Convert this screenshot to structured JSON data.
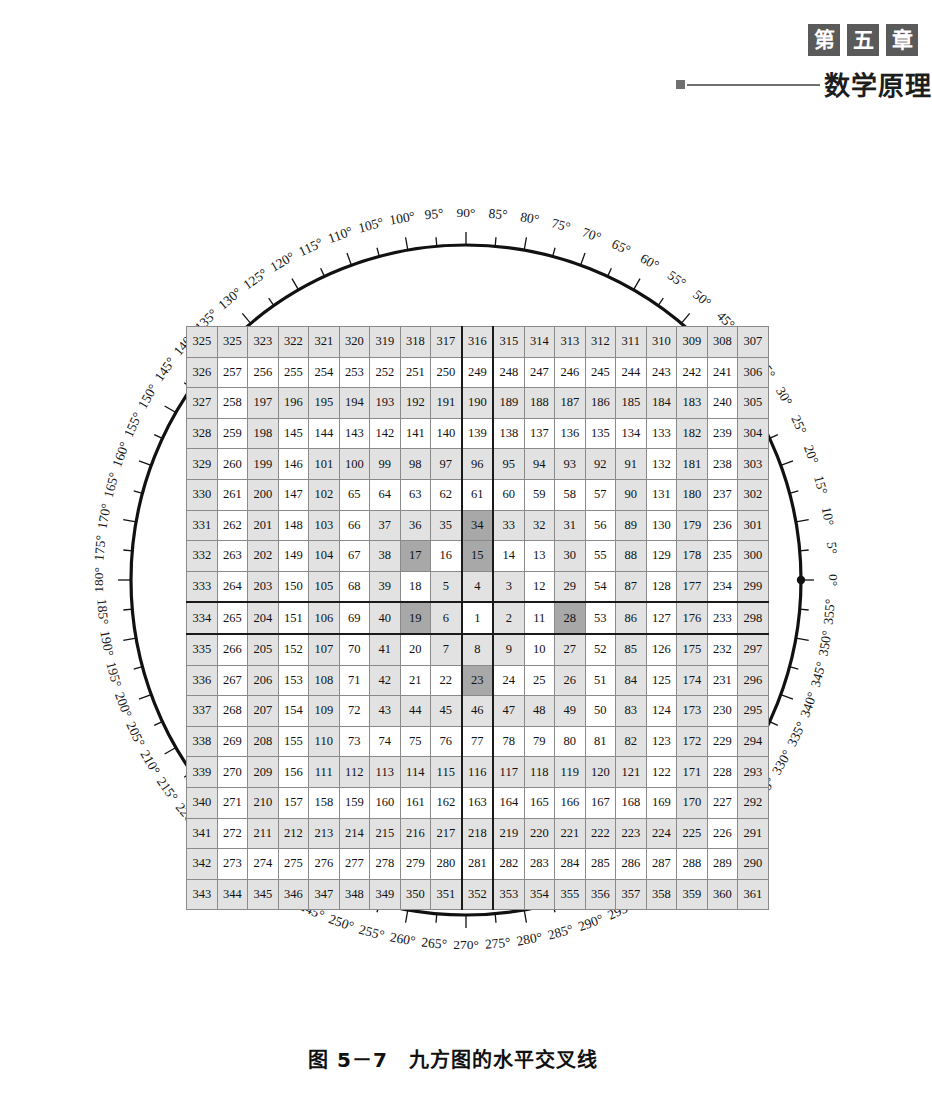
{
  "header": {
    "chapter_boxes": [
      "第",
      "五",
      "章"
    ],
    "running_title": "数学原理"
  },
  "caption": "图 5－7　九方图的水平交叉线",
  "dial": {
    "unit": "°",
    "step": 5,
    "start": 0,
    "count": 72,
    "zero_marker": "dot",
    "labels": [
      "0°",
      "5°",
      "10°",
      "15°",
      "20°",
      "25°",
      "30°",
      "35°",
      "40°",
      "45°",
      "50°",
      "55°",
      "60°",
      "65°",
      "70°",
      "75°",
      "80°",
      "85°",
      "90°",
      "95°",
      "100°",
      "105°",
      "110°",
      "115°",
      "120°",
      "125°",
      "130°",
      "135°",
      "140°",
      "145°",
      "150°",
      "155°",
      "160°",
      "165°",
      "170°",
      "175°",
      "180°",
      "185°",
      "190°",
      "195°",
      "200°",
      "205°",
      "210°",
      "215°",
      "220°",
      "225°",
      "230°",
      "235°",
      "240°",
      "245°",
      "250°",
      "255°",
      "260°",
      "265°",
      "270°",
      "275°",
      "280°",
      "285°",
      "290°",
      "295°",
      "300°",
      "305°",
      "310°",
      "315°",
      "320°",
      "325°",
      "330°",
      "335°",
      "340°",
      "345°",
      "350°",
      "355°"
    ]
  },
  "chart_data": {
    "type": "table",
    "title": "九方图的水平交叉线",
    "rows": 19,
    "cols": 19,
    "center_value": 1,
    "center_row": 10,
    "center_col": 10,
    "highlight_dark": [
      34,
      15,
      17,
      19,
      28,
      23
    ],
    "cross_line_row": 10,
    "cross_line_col": 10,
    "grid": [
      [
        325,
        325,
        323,
        322,
        321,
        320,
        319,
        318,
        317,
        316,
        315,
        314,
        313,
        312,
        311,
        310,
        309,
        308,
        307
      ],
      [
        326,
        257,
        256,
        255,
        254,
        253,
        252,
        251,
        250,
        249,
        248,
        247,
        246,
        245,
        244,
        243,
        242,
        241,
        306
      ],
      [
        327,
        258,
        197,
        196,
        195,
        194,
        193,
        192,
        191,
        190,
        189,
        188,
        187,
        186,
        185,
        184,
        183,
        240,
        305
      ],
      [
        328,
        259,
        198,
        145,
        144,
        143,
        142,
        141,
        140,
        139,
        138,
        137,
        136,
        135,
        134,
        133,
        182,
        239,
        304
      ],
      [
        329,
        260,
        199,
        146,
        101,
        100,
        99,
        98,
        97,
        96,
        95,
        94,
        93,
        92,
        91,
        132,
        181,
        238,
        303
      ],
      [
        330,
        261,
        200,
        147,
        102,
        65,
        64,
        63,
        62,
        61,
        60,
        59,
        58,
        57,
        90,
        131,
        180,
        237,
        302
      ],
      [
        331,
        262,
        201,
        148,
        103,
        66,
        37,
        36,
        35,
        34,
        33,
        32,
        31,
        56,
        89,
        130,
        179,
        236,
        301
      ],
      [
        332,
        263,
        202,
        149,
        104,
        67,
        38,
        17,
        16,
        15,
        14,
        13,
        30,
        55,
        88,
        129,
        178,
        235,
        300
      ],
      [
        333,
        264,
        203,
        150,
        105,
        68,
        39,
        18,
        5,
        4,
        3,
        12,
        29,
        54,
        87,
        128,
        177,
        234,
        299
      ],
      [
        334,
        265,
        204,
        151,
        106,
        69,
        40,
        19,
        6,
        1,
        2,
        11,
        28,
        53,
        86,
        127,
        176,
        233,
        298
      ],
      [
        335,
        266,
        205,
        152,
        107,
        70,
        41,
        20,
        7,
        8,
        9,
        10,
        27,
        52,
        85,
        126,
        175,
        232,
        297
      ],
      [
        336,
        267,
        206,
        153,
        108,
        71,
        42,
        21,
        22,
        23,
        24,
        25,
        26,
        51,
        84,
        125,
        174,
        231,
        296
      ],
      [
        337,
        268,
        207,
        154,
        109,
        72,
        43,
        44,
        45,
        46,
        47,
        48,
        49,
        50,
        83,
        124,
        173,
        230,
        295
      ],
      [
        338,
        269,
        208,
        155,
        110,
        73,
        74,
        75,
        76,
        77,
        78,
        79,
        80,
        81,
        82,
        123,
        172,
        229,
        294
      ],
      [
        339,
        270,
        209,
        156,
        111,
        112,
        113,
        114,
        115,
        116,
        117,
        118,
        119,
        120,
        121,
        122,
        171,
        228,
        293
      ],
      [
        340,
        271,
        210,
        157,
        158,
        159,
        160,
        161,
        162,
        163,
        164,
        165,
        166,
        167,
        168,
        169,
        170,
        227,
        292
      ],
      [
        341,
        272,
        211,
        212,
        213,
        214,
        215,
        216,
        217,
        218,
        219,
        220,
        221,
        222,
        223,
        224,
        225,
        226,
        291
      ],
      [
        342,
        273,
        274,
        275,
        276,
        277,
        278,
        279,
        280,
        281,
        282,
        283,
        284,
        285,
        286,
        287,
        288,
        289,
        290
      ],
      [
        343,
        344,
        345,
        346,
        347,
        348,
        349,
        350,
        351,
        352,
        353,
        354,
        355,
        356,
        357,
        358,
        359,
        360,
        361
      ]
    ]
  },
  "colors": {
    "shaded_cell": "#e2e2e2",
    "dark_cell": "#a8a8a8",
    "white_cell": "#ffffff",
    "grid_line": "#8a8a8a",
    "thick_line": "#1a1a1a",
    "circle": "#111111",
    "chapter_box": "#5a5a5a"
  }
}
